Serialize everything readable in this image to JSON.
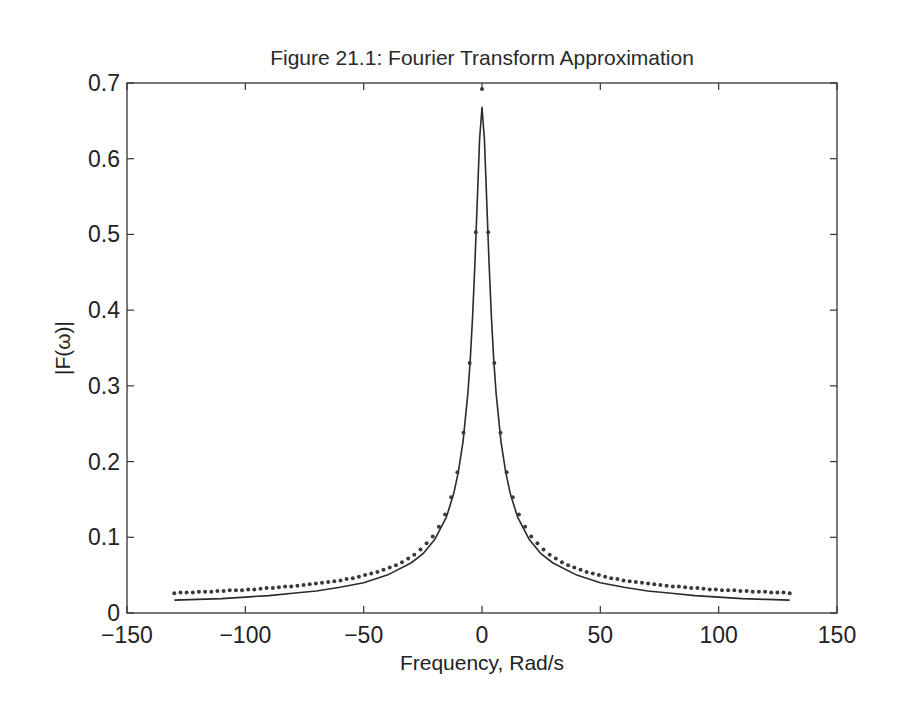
{
  "chart_data": {
    "type": "line",
    "title": "Figure 21.1: Fourier Transform Approximation",
    "xlabel": "Frequency, Rad/s",
    "ylabel": "|F(ω)|",
    "xlim": [
      -150,
      150
    ],
    "ylim": [
      0,
      0.7
    ],
    "xticks": [
      -150,
      -100,
      -50,
      0,
      50,
      100,
      150
    ],
    "xtick_labels": [
      "−150",
      "−100",
      "−50",
      "0",
      "50",
      "100",
      "150"
    ],
    "yticks": [
      0,
      0.1,
      0.2,
      0.3,
      0.4,
      0.5,
      0.6,
      0.7
    ],
    "ytick_labels": [
      "0",
      "0.1",
      "0.2",
      "0.3",
      "0.4",
      "0.5",
      "0.6",
      "0.7"
    ],
    "grid": false,
    "legend": null,
    "series": [
      {
        "name": "approximation (dots)",
        "style": "dots",
        "x_abs": [
          0,
          2.6,
          5.2,
          7.8,
          10.4,
          13,
          15.6,
          18.2,
          20.8,
          23.4,
          26,
          28.6,
          31.2,
          33.8,
          36.4,
          39,
          41.6,
          44.2,
          46.8,
          49.4,
          52,
          54.6,
          57.2,
          59.8,
          62.4,
          65,
          67.6,
          70.2,
          72.8,
          75.4,
          78,
          80.6,
          83.2,
          85.8,
          88.4,
          91,
          93.6,
          96.2,
          98.8,
          101.4,
          104,
          106.6,
          109.2,
          111.8,
          114.4,
          117,
          119.6,
          122.2,
          124.8,
          127.4,
          130
        ],
        "values_abs": [
          0.692,
          0.503,
          0.33,
          0.238,
          0.186,
          0.153,
          0.13,
          0.114,
          0.101,
          0.092,
          0.084,
          0.077,
          0.072,
          0.067,
          0.063,
          0.06,
          0.057,
          0.054,
          0.052,
          0.05,
          0.048,
          0.046,
          0.045,
          0.043,
          0.042,
          0.041,
          0.04,
          0.039,
          0.038,
          0.037,
          0.036,
          0.035,
          0.035,
          0.034,
          0.033,
          0.033,
          0.032,
          0.031,
          0.031,
          0.03,
          0.03,
          0.03,
          0.029,
          0.029,
          0.028,
          0.028,
          0.028,
          0.027,
          0.027,
          0.027,
          0.026
        ],
        "symmetric": true
      },
      {
        "name": "exact transform (solid)",
        "style": "solid",
        "x_abs": [
          0,
          1,
          2,
          3,
          4,
          5,
          6,
          8,
          10,
          12,
          15,
          20,
          25,
          30,
          40,
          50,
          60,
          70,
          80,
          90,
          100,
          110,
          120,
          130
        ],
        "values_abs": [
          0.668,
          0.626,
          0.545,
          0.461,
          0.389,
          0.333,
          0.289,
          0.227,
          0.186,
          0.157,
          0.127,
          0.097,
          0.078,
          0.066,
          0.05,
          0.04,
          0.034,
          0.029,
          0.026,
          0.023,
          0.021,
          0.019,
          0.018,
          0.017
        ],
        "symmetric": true
      }
    ]
  },
  "colors": {
    "axes": "#333333",
    "line": "#2b2b2b",
    "dots": "#3a3a3a"
  }
}
